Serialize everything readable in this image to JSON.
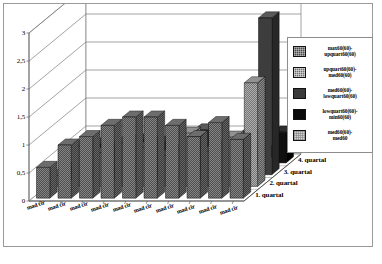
{
  "chart_data": {
    "type": "bar",
    "title": "",
    "xlabel": "",
    "ylabel": "",
    "ylim": [
      0,
      3
    ],
    "grid": true,
    "legend_position": "right",
    "yticks": [
      "3",
      "2,5",
      "2",
      "1,5",
      "1",
      "0,5",
      "0"
    ],
    "ytick_values": [
      3,
      2.5,
      2,
      1.5,
      1,
      0.5,
      0
    ],
    "categories": [
      "mad cir",
      "mad cir",
      "mad cir",
      "mad cir",
      "mad cir",
      "mad cir",
      "mad cir",
      "mad cir",
      "mad cir",
      "mad cir"
    ],
    "depth_categories": [
      "1. quartal",
      "2. quartal",
      "3. quartal",
      "4. quartal"
    ],
    "series": [
      {
        "name": "max60(60)-upquart60(60)",
        "legend_line1": "max60(60)-",
        "legend_line2": "upquart60(60)",
        "color": "#4a4a4a",
        "swatch_class": "sw-max"
      },
      {
        "name": "upquart60(60)-med60(60)",
        "legend_line1": "upquart60(60)-",
        "legend_line2": "med60(60)",
        "color": "#6f6f6f",
        "swatch_class": "sw-up"
      },
      {
        "name": "med60(60)-lowquart60(60)",
        "legend_line1": "med60(60)-",
        "legend_line2": "lowquart60(60)",
        "color": "#3a3a3a",
        "swatch_class": "sw-med"
      },
      {
        "name": "lowquart60(60)-min60(60)",
        "legend_line1": "lowquart60(60)-",
        "legend_line2": "min60(60)",
        "color": "#0a0a0a",
        "swatch_class": "sw-low"
      },
      {
        "name": "med60(60)-med60",
        "legend_line1": "med60(60)-",
        "legend_line2": "med60",
        "color": "#d2d2d2",
        "swatch_class": "sw-mm"
      }
    ],
    "rows": [
      {
        "depth": "4. quartal",
        "series": "max60(60)-upquart60(60)",
        "values": [
          0.55,
          0.95,
          1.1,
          1.3,
          1.45,
          1.45,
          1.3,
          1.1,
          1.35,
          1.05
        ]
      },
      {
        "depth": "3. quartal",
        "series": "upquart60(60)-med60(60)",
        "values": [
          0.2,
          0.72,
          0.6,
          0.78,
          0.7,
          0.55,
          0.95,
          0.62,
          0.88,
          1.85
        ]
      },
      {
        "depth": "2. quartal",
        "series": "med60(60)-lowquart60(60)",
        "values": [
          0.12,
          0.55,
          0.5,
          0.62,
          0.58,
          0.46,
          0.8,
          0.52,
          0.7,
          2.8
        ]
      },
      {
        "depth": "1. quartal",
        "series": "lowquart60(60)-min60(60)",
        "values": [
          0.06,
          0.14,
          0.12,
          0.18,
          0.16,
          0.12,
          0.22,
          0.14,
          0.2,
          0.55
        ]
      }
    ],
    "max_value": 2.8,
    "max_value_label": "2,8"
  }
}
